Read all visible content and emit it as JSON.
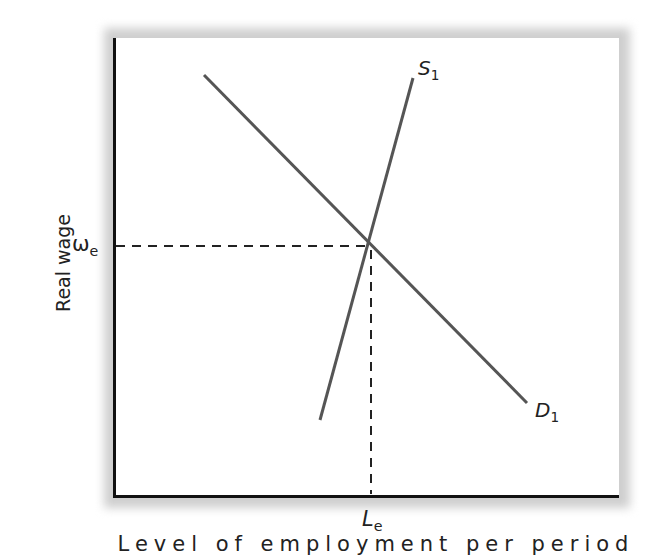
{
  "diagram": {
    "type": "supply-demand",
    "y_axis_label": "Real wage",
    "x_axis_label": "Level of employment per period",
    "equilibrium": {
      "wage_symbol": "ω",
      "wage_subscript": "e",
      "labor_symbol": "L",
      "labor_subscript": "e"
    },
    "curves": [
      {
        "id": "supply",
        "symbol": "S",
        "subscript": "1",
        "from": [
          320,
          420
        ],
        "to": [
          413,
          78
        ]
      },
      {
        "id": "demand",
        "symbol": "D",
        "subscript": "1",
        "from": [
          204,
          75
        ],
        "to": [
          527,
          403
        ]
      }
    ],
    "equilibrium_point": [
      369,
      246
    ],
    "colors": {
      "axis": "#111111",
      "curve": "#555555",
      "guide": "#222222",
      "shadow": "#cfcfcf"
    }
  }
}
